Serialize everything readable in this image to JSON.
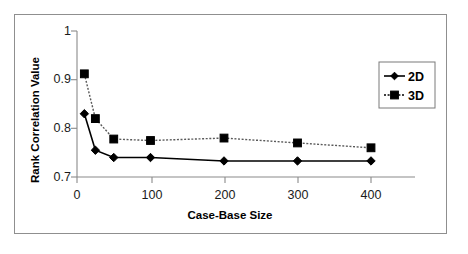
{
  "chart_data": {
    "type": "line",
    "title": "",
    "xlabel": "Case-Base Size",
    "ylabel": "Rank Correlation Value",
    "xlim": [
      0,
      420
    ],
    "ylim": [
      0.7,
      1.0
    ],
    "xticks": [
      0,
      100,
      200,
      300,
      400
    ],
    "xtick_labels": [
      "0",
      "100",
      "200",
      "300",
      "400"
    ],
    "yticks": [
      0.7,
      0.8,
      0.9,
      1.0
    ],
    "ytick_labels": [
      "0.7",
      "0.8",
      "0.9",
      "1"
    ],
    "grid": false,
    "legend_position": "right-outside",
    "x": [
      10,
      25,
      50,
      100,
      200,
      300,
      400
    ],
    "series": [
      {
        "name": "2D",
        "marker": "diamond",
        "line_style": "solid",
        "color": "#000000",
        "values": [
          0.83,
          0.755,
          0.74,
          0.74,
          0.733,
          0.733,
          0.733
        ]
      },
      {
        "name": "3D",
        "marker": "square",
        "line_style": "dotted",
        "color": "#000000",
        "values": [
          0.912,
          0.82,
          0.778,
          0.775,
          0.78,
          0.77,
          0.76
        ]
      }
    ]
  },
  "legend": {
    "entries": [
      {
        "label": "2D"
      },
      {
        "label": "3D"
      }
    ]
  },
  "axes": {
    "y_title": "Rank Correlation Value",
    "x_title": "Case-Base Size",
    "y_tick_0": "1",
    "y_tick_1": "0.9",
    "y_tick_2": "0.8",
    "y_tick_3": "0.7",
    "x_tick_0": "0",
    "x_tick_1": "100",
    "x_tick_2": "200",
    "x_tick_3": "300",
    "x_tick_4": "400"
  }
}
